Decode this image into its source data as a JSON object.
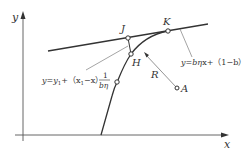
{
  "axes": {
    "x_label": "x",
    "y_label": "y"
  },
  "points": {
    "J": "J",
    "K": "K",
    "H": "H",
    "A": "A"
  },
  "radius_label": "R",
  "line_equation": {
    "lhs": "y=b",
    "eta": "η",
    "rest": "x+（1−b）"
  },
  "normal_equation": {
    "lhs": "y=y",
    "sub1": "1",
    "mid": "+（x",
    "sub2": "1",
    "tail": "−x）",
    "frac_num": "1",
    "frac_den": "bη"
  },
  "colors": {
    "stroke": "#333333",
    "thin": "#666666",
    "axis": "#555555"
  }
}
